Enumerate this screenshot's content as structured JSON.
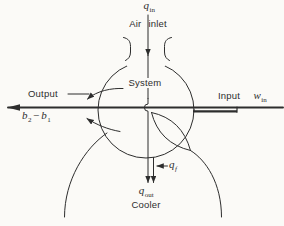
{
  "colors": {
    "ink": "#2d2d2d",
    "background": "#fbfaf7"
  },
  "labels": {
    "q_in": {
      "base": "q",
      "sub": "in"
    },
    "air_inlet": {
      "word1": "Air",
      "word2": "inlet"
    },
    "system": "System",
    "output": "Output",
    "b2_minus_b1": {
      "base1": "b",
      "sub1": "2",
      "operator": "−",
      "base2": "b",
      "sub2": "1"
    },
    "input": "Input",
    "w_in": {
      "base": "w",
      "sub": "in"
    },
    "q_f": {
      "base": "q",
      "sub": "f"
    },
    "q_out": {
      "base": "q",
      "sub": "out"
    },
    "cooler": "Cooler"
  }
}
